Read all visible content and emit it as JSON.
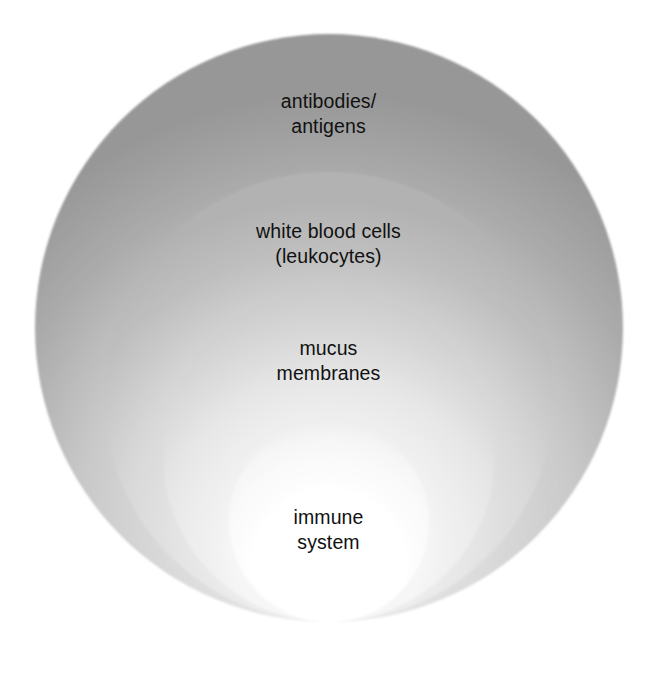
{
  "figure": {
    "background_color": "#ffffff",
    "text_color": "#111111"
  },
  "chart_data": {
    "type": "diagram",
    "subtype": "concentric-circles",
    "title": "",
    "xlabel": "",
    "ylabel": "",
    "grid": false,
    "legend": "none",
    "note": "Four nested circles tangent at the bottom; each filled with a light-to-gray radial gradient. Outermost layer is listed first.",
    "layers": [
      {
        "order": 1,
        "name": "antibodies/antigens",
        "label_line_1": "antibodies/",
        "label_line_2": "antigens",
        "center_x": 329,
        "center_y": 328,
        "radius": 294,
        "edge_color": "#9a9a9a",
        "center_color": "#efefef"
      },
      {
        "order": 2,
        "name": "white blood cells (leukocytes)",
        "label_line_1": "white blood cells",
        "label_line_2": "(leukocytes)",
        "center_x": 329,
        "center_y": 397,
        "radius": 225,
        "edge_color": "#b4b4b4",
        "center_color": "#f4f4f4"
      },
      {
        "order": 3,
        "name": "mucus membranes",
        "label_line_1": "mucus",
        "label_line_2": "membranes",
        "center_x": 329,
        "center_y": 456,
        "radius": 166,
        "edge_color": "#cdcdcd",
        "center_color": "#fafafa"
      },
      {
        "order": 4,
        "name": "immune system",
        "label_line_1": "immune",
        "label_line_2": "system",
        "center_x": 329,
        "center_y": 522,
        "radius": 100,
        "edge_color": "#e6e6e6",
        "center_color": "#ffffff"
      }
    ]
  },
  "labels": {
    "antibodies": "antibodies/\nantigens",
    "white_blood_cells": "white blood cells\n(leukocytes)",
    "mucus_membranes": "mucus\nmembranes",
    "immune_system": "immune\nsystem"
  }
}
